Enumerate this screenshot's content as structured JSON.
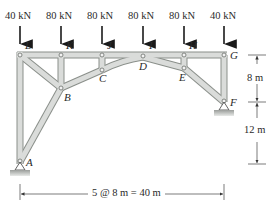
{
  "loads": [
    {
      "label": "40 kN",
      "x": 20
    },
    {
      "label": "80 kN",
      "x": 61
    },
    {
      "label": "80 kN",
      "x": 102
    },
    {
      "label": "80 kN",
      "x": 143
    },
    {
      "label": "80 kN",
      "x": 184
    },
    {
      "label": "40 kN",
      "x": 224
    }
  ],
  "joints": {
    "L": "L",
    "K": "K",
    "J": "J",
    "I": "I",
    "H": "H",
    "G": "G",
    "C": "C",
    "D": "D",
    "E": "E",
    "B": "B",
    "F": "F",
    "A": "A"
  },
  "dimensions": {
    "upper_vertical": "8 m",
    "lower_vertical": "12 m",
    "horizontal": "5 @ 8 m = 40 m"
  },
  "colors": {
    "member_fill": "#d9dcd9",
    "member_stroke": "#8a8f8a",
    "text": "#2a2a2a",
    "dimension": "#555555",
    "ground": "#b8bbb8"
  }
}
